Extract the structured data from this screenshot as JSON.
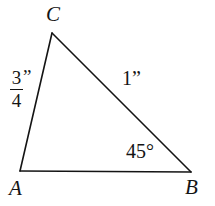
{
  "figure": {
    "type": "triangle-diagram",
    "background_color": "#ffffff",
    "stroke_color": "#141414",
    "stroke_width": 1.6,
    "width": 215,
    "height": 206,
    "vertices": {
      "A": {
        "x": 20,
        "y": 171
      },
      "B": {
        "x": 191,
        "y": 172
      },
      "C": {
        "x": 52,
        "y": 33
      }
    },
    "vertex_labels": {
      "A": "A",
      "B": "B",
      "C": "C"
    },
    "measurements": {
      "side_AC": {
        "numerator": "3",
        "denominator": "4",
        "unit": "”"
      },
      "side_CB": "1”",
      "angle_B": "45°"
    }
  }
}
